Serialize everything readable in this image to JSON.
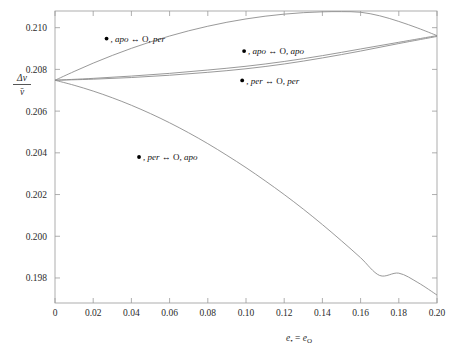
{
  "figure": {
    "background_color": "#ffffff",
    "curve_color": "#8d8d8d",
    "frame_color": "#9a9a9a",
    "text_color": "#2b2b2b"
  },
  "chart_data": {
    "type": "line",
    "title": "",
    "subtitle": "",
    "xlabel": "e• = eₒ",
    "xlabel_parts": {
      "base1": "e",
      "sub1": "•",
      "eq": " = ",
      "base2": "e",
      "sub2": "O"
    },
    "ylabel": "Δv / v̄",
    "ylabel_parts": {
      "numerator": "Δv",
      "denominator": "v̄"
    },
    "xlim": [
      0,
      0.2
    ],
    "ylim": [
      0.1968,
      0.2108
    ],
    "grid": false,
    "legend_position": "inline-annotations",
    "xticks": [
      0,
      0.02,
      0.04,
      0.06,
      0.08,
      0.1,
      0.12,
      0.14,
      0.16,
      0.18,
      0.2
    ],
    "xticklabels": [
      "0",
      "0.02",
      "0.04",
      "0.06",
      "0.08",
      "0.10",
      "0.12",
      "0.14",
      "0.16",
      "0.18",
      "0.20"
    ],
    "yticks": [
      0.198,
      0.2,
      0.202,
      0.204,
      0.206,
      0.208,
      0.21
    ],
    "yticklabels": [
      "0.198",
      "0.200",
      "0.202",
      "0.204",
      "0.206",
      "0.208",
      "0.210"
    ],
    "series": [
      {
        "name": "•, apo ↔ O, per",
        "label_parts": {
          "marker": "•",
          "body1": ", apo ↔ ",
          "body2": "O",
          "body3": ", per"
        },
        "color": "#8d8d8d",
        "x": [
          0,
          0.01,
          0.02,
          0.03,
          0.04,
          0.05,
          0.06,
          0.07,
          0.08,
          0.09,
          0.1,
          0.11,
          0.12,
          0.13,
          0.14,
          0.15,
          0.16,
          0.17,
          0.18,
          0.19,
          0.2
        ],
        "values": [
          0.20748,
          0.2079,
          0.2083,
          0.20867,
          0.20901,
          0.20932,
          0.2096,
          0.20985,
          0.21007,
          0.21026,
          0.21042,
          0.21055,
          0.21065,
          0.21072,
          0.21076,
          0.21077,
          0.21074,
          0.21057,
          0.2103,
          0.20998,
          0.20962
        ]
      },
      {
        "name": "•, apo ↔ O, apo",
        "label_parts": {
          "marker": "•",
          "body1": ", apo ↔ ",
          "body2": "O",
          "body3": ", apo"
        },
        "color": "#8d8d8d",
        "x": [
          0,
          0.02,
          0.04,
          0.06,
          0.08,
          0.1,
          0.12,
          0.14,
          0.16,
          0.18,
          0.2
        ],
        "values": [
          0.20748,
          0.20757,
          0.20768,
          0.20781,
          0.20797,
          0.20815,
          0.20838,
          0.20866,
          0.20898,
          0.2093,
          0.20962
        ]
      },
      {
        "name": "•, per ↔ O, per",
        "label_parts": {
          "marker": "•",
          "body1": ", per ↔ ",
          "body2": "O",
          "body3": ", per"
        },
        "color": "#8d8d8d",
        "x": [
          0,
          0.02,
          0.04,
          0.06,
          0.08,
          0.1,
          0.12,
          0.14,
          0.16,
          0.18,
          0.2
        ],
        "values": [
          0.20748,
          0.20753,
          0.20761,
          0.20772,
          0.20786,
          0.20803,
          0.20826,
          0.20855,
          0.20888,
          0.20924,
          0.20958
        ]
      },
      {
        "name": "•, per ↔ O, apo",
        "label_parts": {
          "marker": "•",
          "body1": ", per ↔ ",
          "body2": "O",
          "body3": ", apo"
        },
        "color": "#8d8d8d",
        "x": [
          0,
          0.01,
          0.02,
          0.03,
          0.04,
          0.05,
          0.06,
          0.07,
          0.08,
          0.09,
          0.1,
          0.11,
          0.12,
          0.13,
          0.14,
          0.15,
          0.16,
          0.17,
          0.18,
          0.19,
          0.2
        ],
        "values": [
          0.20748,
          0.20724,
          0.20696,
          0.20664,
          0.20628,
          0.20588,
          0.20544,
          0.20496,
          0.20444,
          0.20388,
          0.20329,
          0.20266,
          0.202,
          0.2013,
          0.20056,
          0.19978,
          0.19897,
          0.19812,
          0.19823,
          0.19778,
          0.19718
        ]
      }
    ],
    "annotations": [
      {
        "series": "•, apo ↔ O, per",
        "x": 0.027,
        "y": 0.20948,
        "text": "•, apo ↔ O, per"
      },
      {
        "series": "•, apo ↔ O, apo",
        "x": 0.099,
        "y": 0.20888,
        "text": "•, apo ↔ O, apo"
      },
      {
        "series": "•, per ↔ O, per",
        "x": 0.098,
        "y": 0.20747,
        "text": "•, per ↔ O, per"
      },
      {
        "series": "•, per ↔ O, apo",
        "x": 0.044,
        "y": 0.2038,
        "text": "•, per ↔ O, apo"
      }
    ]
  }
}
